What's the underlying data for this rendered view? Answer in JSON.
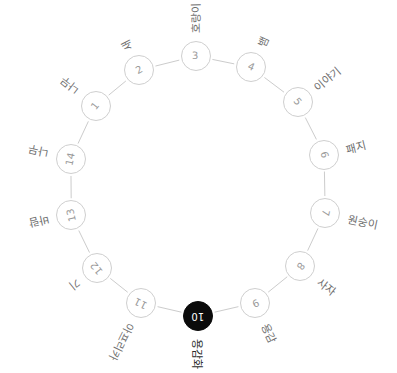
{
  "diagram": {
    "type": "circular-node-link-graph",
    "title": "",
    "background_color": "#ffffff",
    "node_fill": "#ffffff",
    "node_stroke": "#cfcfcf",
    "node_text_color": "#9a9a9a",
    "edge_color": "#cccccc",
    "highlight_fill": "#0b0b0b",
    "highlight_text_color": "#ffffff",
    "label_color": "#6f6f6f",
    "center": {
      "x": 198,
      "y": 186
    },
    "radius": 130,
    "nodes": [
      {
        "id": "1",
        "number": "1",
        "label": "나무",
        "angle": 218,
        "highlight": false,
        "label_rotation": 218
      },
      {
        "id": "2",
        "number": "2",
        "label": "새",
        "angle": 243,
        "highlight": false,
        "label_rotation": 243
      },
      {
        "id": "3",
        "number": "3",
        "label": "호랑이",
        "angle": 269,
        "highlight": false,
        "label_rotation": 269
      },
      {
        "id": "4",
        "number": "4",
        "label": "뱀",
        "angle": 294,
        "highlight": false,
        "label_rotation": 294
      },
      {
        "id": "5",
        "number": "5",
        "label": "이야기",
        "angle": 320,
        "highlight": false,
        "label_rotation": 320
      },
      {
        "id": "6",
        "number": "6",
        "label": "패지",
        "angle": 346,
        "highlight": false,
        "label_rotation": 346
      },
      {
        "id": "7",
        "number": "7",
        "label": "원숭이",
        "angle": 12,
        "highlight": false,
        "label_rotation": 12
      },
      {
        "id": "8",
        "number": "8",
        "label": "사자",
        "angle": 38,
        "highlight": false,
        "label_rotation": 38
      },
      {
        "id": "9",
        "number": "9",
        "label": "용감",
        "angle": 64,
        "highlight": false,
        "label_rotation": 64
      },
      {
        "id": "10",
        "number": "10",
        "label": "용감화",
        "angle": 90,
        "highlight": true,
        "label_rotation": 90
      },
      {
        "id": "11",
        "number": "11",
        "label": "아프리카",
        "angle": 116,
        "highlight": false,
        "label_rotation": 116
      },
      {
        "id": "12",
        "number": "12",
        "label": "기",
        "angle": 141,
        "highlight": false,
        "label_rotation": 141
      },
      {
        "id": "13",
        "number": "13",
        "label": "바람",
        "angle": 167,
        "highlight": false,
        "label_rotation": 167
      },
      {
        "id": "14",
        "number": "14",
        "label": "나무",
        "angle": 192,
        "highlight": false,
        "label_rotation": 192
      }
    ],
    "edges": [
      {
        "from": "1",
        "to": "2"
      },
      {
        "from": "2",
        "to": "3"
      },
      {
        "from": "3",
        "to": "4"
      },
      {
        "from": "4",
        "to": "5"
      },
      {
        "from": "5",
        "to": "6"
      },
      {
        "from": "6",
        "to": "7"
      },
      {
        "from": "7",
        "to": "8"
      },
      {
        "from": "8",
        "to": "9"
      },
      {
        "from": "9",
        "to": "10"
      },
      {
        "from": "10",
        "to": "11"
      },
      {
        "from": "11",
        "to": "12"
      },
      {
        "from": "12",
        "to": "13"
      },
      {
        "from": "13",
        "to": "14"
      },
      {
        "from": "14",
        "to": "1"
      }
    ]
  }
}
